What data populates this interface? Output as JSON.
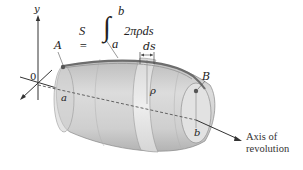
{
  "figure": {
    "formula": {
      "lhs": "S =",
      "integral": "∫",
      "upper": "b",
      "lower": "a",
      "integrand": "2πρds"
    },
    "labels": {
      "y_axis": "y",
      "origin": "0",
      "point_a": "A",
      "point_b": "B",
      "a": "a",
      "b": "b",
      "rho": "ρ",
      "ds": "ds"
    },
    "axis_label": {
      "line1": "Axis of",
      "line2": "revolution"
    },
    "colors": {
      "surface_light": "#d9d9d9",
      "surface_mid": "#c4c4c4",
      "surface_dark": "#a9a9a9",
      "band": "#e6e6e6",
      "curve": "#6d6d6d",
      "ink": "#222222"
    }
  }
}
